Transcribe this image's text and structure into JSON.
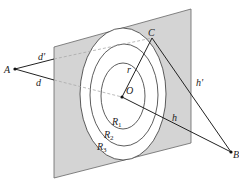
{
  "diagram": {
    "type": "geometry",
    "colors": {
      "plane_fill": "#d4d4d4",
      "plane_stroke": "#666666",
      "ring_fill": "#ffffff",
      "line": "#222222",
      "hidden_line": "#aaaaaa"
    },
    "points": {
      "A": {
        "label": "A",
        "x": 15,
        "y": 69
      },
      "B": {
        "label": "B",
        "x": 231,
        "y": 152
      },
      "O": {
        "label": "O",
        "x": 122,
        "y": 97
      },
      "C": {
        "label": "C",
        "x": 152,
        "y": 38
      }
    },
    "segments": {
      "d_prime": {
        "label": "d'"
      },
      "d": {
        "label": "d"
      },
      "h_prime": {
        "label": "h'"
      },
      "h": {
        "label": "h"
      },
      "r": {
        "label": "r"
      }
    },
    "regions": [
      {
        "label": "R",
        "sub": "1"
      },
      {
        "label": "R",
        "sub": "2"
      },
      {
        "label": "R",
        "sub": "3"
      }
    ]
  }
}
